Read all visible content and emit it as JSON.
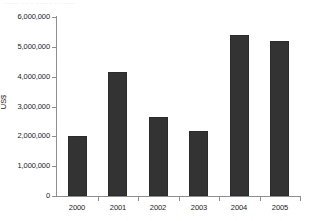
{
  "figure": {
    "top_cut_text": "........ .... .. ......... ... ......."
  },
  "chart_data": {
    "type": "bar",
    "title": "",
    "subtitle": "",
    "xlabel": "",
    "ylabel": "US$",
    "categories": [
      "2000",
      "2001",
      "2002",
      "2003",
      "2004",
      "2005"
    ],
    "values": [
      2000000,
      4150000,
      2650000,
      2170000,
      5400000,
      5200000
    ],
    "ylim": [
      0,
      6000000
    ],
    "ytick_values": [
      0,
      1000000,
      2000000,
      3000000,
      4000000,
      5000000,
      6000000
    ],
    "ytick_labels": [
      "0",
      "1,000,000",
      "2,000,000",
      "3,000,000",
      "4,000,000",
      "5,000,000",
      "6,000,000"
    ],
    "grid": false,
    "legend": null,
    "bar_color": "#333333",
    "axis_color": "#8e8e8e",
    "orientation": "vertical"
  }
}
